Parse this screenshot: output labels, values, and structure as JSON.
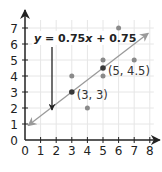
{
  "chart_data": {
    "type": "scatter",
    "title": "",
    "xlabel": "",
    "ylabel": "",
    "xlim": [
      0,
      8
    ],
    "ylim": [
      0,
      7
    ],
    "x_ticks": [
      "0",
      "1",
      "2",
      "3",
      "4",
      "5",
      "6",
      "7",
      "8"
    ],
    "y_ticks": [
      "0",
      "1",
      "2",
      "3",
      "4",
      "5",
      "6",
      "7"
    ],
    "grid": true,
    "points": [
      {
        "x": 3,
        "y": 4,
        "highlight": false
      },
      {
        "x": 3,
        "y": 3,
        "highlight": true
      },
      {
        "x": 4,
        "y": 2,
        "highlight": false
      },
      {
        "x": 5,
        "y": 5,
        "highlight": false
      },
      {
        "x": 5,
        "y": 4.5,
        "highlight": true
      },
      {
        "x": 5,
        "y": 4,
        "highlight": false
      },
      {
        "x": 6,
        "y": 7,
        "highlight": false
      },
      {
        "x": 7,
        "y": 5,
        "highlight": false
      }
    ],
    "trend_line": {
      "equation_label": "y = 0.75x + 0.75",
      "slope": 0.75,
      "intercept": 0.75,
      "x_range": [
        0.2,
        7.9
      ]
    },
    "annotations": [
      {
        "text": "(3, 3)",
        "x": 3,
        "y": 3
      },
      {
        "text": "(5, 4.5)",
        "x": 5,
        "y": 4.5
      }
    ],
    "colors": {
      "axis": "#222222",
      "grid": "#e6e6e6",
      "point": "#8a8a8a",
      "highlight_point": "#3a3a3a",
      "trend_line": "#9a9a9a",
      "pointer_arrow": "#222222"
    }
  }
}
